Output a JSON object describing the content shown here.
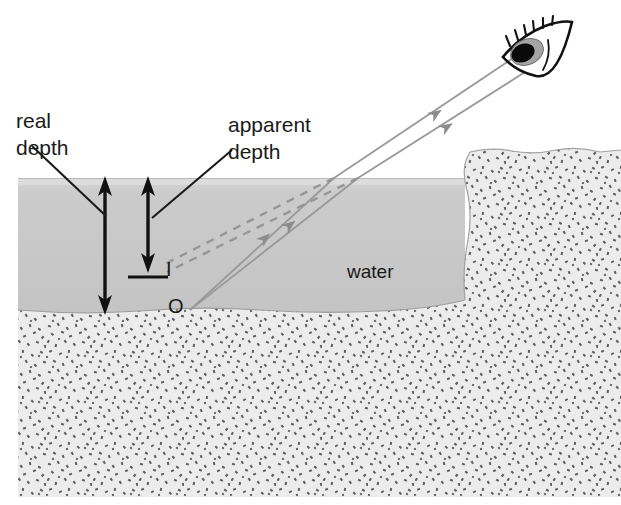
{
  "figure": {
    "kind": "optics-refraction-diagram",
    "labels": {
      "real_depth_line1": "real",
      "real_depth_line2": "depth",
      "apparent_depth_line1": "apparent",
      "apparent_depth_line2": "depth",
      "water": "water",
      "image_point": "I",
      "object_point": "O"
    },
    "colors": {
      "water_fill": "#c9c9c9",
      "water_surface_band": "#dedede",
      "sand_base": "#e9e9e9",
      "sand_speckle": "#5a5a5a",
      "ray_solid": "#8c8c8c",
      "ray_dashed": "#949494",
      "measure_arrow": "#111111",
      "leader_line": "#1a1a1a",
      "text": "#1a1a1a",
      "eye_outline": "#111111",
      "eye_iris": "#9a9a9a",
      "eye_pupil": "#050505",
      "background": "#ffffff"
    },
    "geometry": {
      "water_surface_y": 178,
      "sand_top_y": 310,
      "sand_bottom_y": 497,
      "ledge_left_x": 465,
      "ledge_top_y": 150,
      "object_point": [
        190,
        310
      ],
      "image_point": [
        160,
        268
      ],
      "eye_position": [
        528,
        42
      ],
      "real_depth_arrow_x": 105,
      "apparent_depth_arrow_x": 148,
      "apparent_depth_tick_y": 268
    }
  }
}
